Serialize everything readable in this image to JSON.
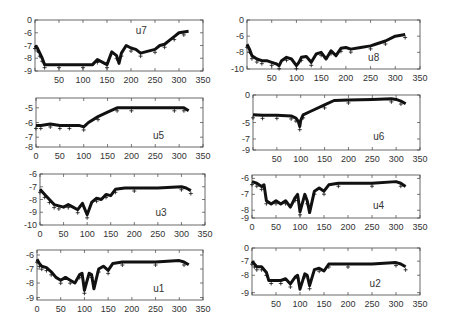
{
  "chart_data": [
    {
      "type": "scatter",
      "title": "u7",
      "label": "u7",
      "xlim": [
        0,
        350
      ],
      "ylim_display": [
        -9,
        0
      ],
      "xticks": [
        50,
        100,
        150,
        200,
        250,
        300,
        350
      ],
      "yticks": [
        "0",
        "-6",
        "-7",
        "-8",
        "-9"
      ],
      "series": [
        {
          "name": "u7",
          "x": [
            0,
            5,
            10,
            15,
            20,
            30,
            50,
            80,
            100,
            120,
            130,
            140,
            150,
            160,
            170,
            175,
            180,
            190,
            200,
            210,
            220,
            240,
            250,
            260,
            270,
            280,
            290,
            300,
            310,
            320
          ],
          "y": [
            -7.0,
            -7.2,
            -7.6,
            -8.0,
            -8.5,
            -8.5,
            -8.5,
            -8.5,
            -8.5,
            -8.5,
            -8.1,
            -8.3,
            -8.5,
            -7.5,
            -7.8,
            -8.4,
            -7.6,
            -7.0,
            -7.2,
            -7.3,
            -7.6,
            -7.4,
            -7.3,
            -7.0,
            -6.9,
            -6.6,
            -6.3,
            -6.0,
            -5.6,
            -5.3
          ]
        }
      ],
      "label_pos": [
        0.6,
        0.2
      ]
    },
    {
      "type": "scatter",
      "title": "u8",
      "label": "u8",
      "xlim": [
        0,
        350
      ],
      "ylim_display": [
        -10,
        0
      ],
      "xticks": [
        50,
        100,
        150,
        200,
        250,
        300,
        350
      ],
      "yticks": [
        "0",
        "-6",
        "-8",
        "-10"
      ],
      "series": [
        {
          "name": "u8",
          "x": [
            0,
            5,
            10,
            20,
            30,
            40,
            50,
            60,
            65,
            70,
            80,
            90,
            100,
            105,
            110,
            120,
            130,
            140,
            150,
            160,
            170,
            180,
            190,
            200,
            210,
            230,
            250,
            260,
            280,
            300,
            320
          ],
          "y": [
            -7.0,
            -7.6,
            -8.4,
            -8.8,
            -9.0,
            -9.0,
            -9.2,
            -9.4,
            -9.6,
            -9.0,
            -8.6,
            -8.8,
            -9.6,
            -9.2,
            -8.6,
            -8.5,
            -9.2,
            -8.2,
            -8.0,
            -8.8,
            -7.8,
            -8.4,
            -7.5,
            -7.4,
            -7.6,
            -7.4,
            -7.2,
            -7.0,
            -6.6,
            -6.0,
            -5.4
          ]
        }
      ],
      "label_pos": [
        0.7,
        0.75
      ]
    },
    {
      "type": "scatter",
      "title": "u5",
      "label": "u5",
      "xlim": [
        0,
        350
      ],
      "ylim_display": [
        -8,
        -4.5
      ],
      "xticks": [
        0,
        50,
        100,
        150,
        200,
        250,
        300,
        350
      ],
      "yticks": [
        "-5",
        "-6",
        "-7",
        "-8"
      ],
      "series": [
        {
          "name": "u5",
          "x": [
            0,
            10,
            30,
            50,
            70,
            90,
            100,
            110,
            130,
            150,
            170,
            180,
            200,
            250,
            290,
            300,
            310,
            320
          ],
          "y": [
            -6.2,
            -6.2,
            -6.1,
            -6.2,
            -6.2,
            -6.2,
            -6.3,
            -6.0,
            -5.6,
            -5.3,
            -5.0,
            -5.0,
            -5.0,
            -5.0,
            -4.9,
            -4.9,
            -5.0,
            -5.2
          ]
        }
      ],
      "label_pos": [
        0.7,
        0.75
      ]
    },
    {
      "type": "scatter",
      "title": "u6",
      "label": "u6",
      "xlim": [
        0,
        350
      ],
      "ylim_display": [
        -9,
        0
      ],
      "xticks": [
        50,
        100,
        150,
        200,
        250,
        300,
        350
      ],
      "yticks": [
        "0",
        "-5",
        "-7",
        "-9"
      ],
      "series": [
        {
          "name": "u6",
          "x": [
            0,
            20,
            50,
            80,
            90,
            95,
            98,
            100,
            105,
            120,
            150,
            170,
            200,
            250,
            290,
            300,
            310,
            320
          ],
          "y": [
            -3.6,
            -3.7,
            -3.7,
            -3.8,
            -4.2,
            -4.8,
            -5.5,
            -4.6,
            -3.6,
            -3.0,
            -1.8,
            -1.0,
            -0.9,
            -0.8,
            -0.7,
            -0.8,
            -1.1,
            -1.6
          ]
        }
      ],
      "label_pos": [
        0.72,
        0.75
      ]
    },
    {
      "type": "scatter",
      "title": "u3",
      "label": "u3",
      "xlim": [
        0,
        350
      ],
      "ylim_display": [
        -10,
        -6
      ],
      "xticks": [
        0,
        50,
        100,
        150,
        200,
        250,
        300,
        350
      ],
      "yticks": [
        "-6",
        "-7",
        "-8",
        "-9",
        "-10"
      ],
      "series": [
        {
          "name": "u3",
          "x": [
            0,
            10,
            20,
            30,
            40,
            50,
            60,
            70,
            80,
            90,
            100,
            110,
            120,
            130,
            140,
            150,
            160,
            180,
            200,
            250,
            300,
            310,
            320
          ],
          "y": [
            -7.2,
            -7.6,
            -8.0,
            -8.4,
            -8.5,
            -8.6,
            -8.4,
            -8.6,
            -8.8,
            -8.3,
            -9.2,
            -8.2,
            -7.9,
            -8.0,
            -7.6,
            -7.7,
            -7.2,
            -7.1,
            -7.1,
            -7.1,
            -7.0,
            -7.1,
            -7.3
          ]
        }
      ],
      "label_pos": [
        0.7,
        0.75
      ]
    },
    {
      "type": "scatter",
      "title": "u4",
      "label": "u4",
      "xlim": [
        0,
        350
      ],
      "ylim_display": [
        -9,
        -5.5
      ],
      "xticks": [
        0,
        50,
        100,
        150,
        200,
        250,
        300,
        350
      ],
      "yticks": [
        "-6",
        "-7",
        "-8",
        "-9"
      ],
      "series": [
        {
          "name": "u4",
          "x": [
            0,
            10,
            20,
            25,
            30,
            40,
            50,
            60,
            70,
            80,
            90,
            95,
            100,
            110,
            115,
            120,
            130,
            140,
            150,
            160,
            180,
            200,
            250,
            300,
            310,
            320
          ],
          "y": [
            -6.2,
            -6.3,
            -6.5,
            -6.4,
            -7.4,
            -7.6,
            -7.4,
            -7.6,
            -7.4,
            -7.8,
            -7.2,
            -7.0,
            -8.2,
            -7.0,
            -7.4,
            -8.3,
            -6.8,
            -6.6,
            -6.8,
            -6.4,
            -6.3,
            -6.3,
            -6.3,
            -6.2,
            -6.3,
            -6.5
          ]
        }
      ],
      "label_pos": [
        0.72,
        0.7
      ]
    },
    {
      "type": "scatter",
      "title": "u1",
      "label": "u1",
      "xlim": [
        0,
        350
      ],
      "ylim_display": [
        -9,
        -5.7
      ],
      "xticks": [
        0,
        50,
        100,
        150,
        200,
        250,
        300,
        350
      ],
      "yticks": [
        "-6",
        "-7",
        "-8",
        "-9"
      ],
      "series": [
        {
          "name": "u1",
          "x": [
            0,
            5,
            10,
            20,
            30,
            40,
            50,
            60,
            70,
            80,
            90,
            95,
            100,
            110,
            115,
            120,
            130,
            140,
            150,
            160,
            180,
            200,
            250,
            300,
            310,
            320
          ],
          "y": [
            -6.3,
            -6.6,
            -6.8,
            -6.9,
            -7.2,
            -7.6,
            -7.8,
            -7.6,
            -7.8,
            -8.0,
            -7.4,
            -7.3,
            -8.5,
            -7.3,
            -7.4,
            -8.4,
            -7.0,
            -6.8,
            -7.1,
            -6.6,
            -6.5,
            -6.5,
            -6.5,
            -6.4,
            -6.5,
            -6.7
          ]
        }
      ],
      "label_pos": [
        0.7,
        0.75
      ]
    },
    {
      "type": "scatter",
      "title": "u2",
      "label": "u2",
      "xlim": [
        0,
        350
      ],
      "ylim_display": [
        -9,
        0
      ],
      "xticks": [
        50,
        100,
        150,
        200,
        250,
        300,
        350
      ],
      "yticks": [
        "0",
        "-7",
        "-8",
        "-9"
      ],
      "series": [
        {
          "name": "u2",
          "x": [
            0,
            5,
            10,
            20,
            30,
            35,
            40,
            50,
            60,
            70,
            80,
            90,
            95,
            100,
            110,
            115,
            120,
            130,
            140,
            150,
            160,
            180,
            200,
            250,
            300,
            310,
            320
          ],
          "y": [
            -7.0,
            -7.2,
            -7.4,
            -7.4,
            -7.8,
            -8.3,
            -8.3,
            -8.3,
            -8.3,
            -8.2,
            -8.5,
            -8.1,
            -8.0,
            -8.8,
            -7.9,
            -8.0,
            -8.6,
            -7.6,
            -7.5,
            -7.7,
            -7.2,
            -7.2,
            -7.2,
            -7.2,
            -7.1,
            -7.2,
            -7.4
          ]
        }
      ],
      "label_pos": [
        0.7,
        0.75
      ]
    }
  ],
  "panels": [
    {
      "label": "u7",
      "box": [
        35,
        20,
        203,
        71
      ],
      "ymap": {
        "0": 0.0,
        "-6": 0.25,
        "-7": 0.5,
        "-8": 0.75,
        "-9": 1.0
      },
      "xtick_labels_start": 50
    },
    {
      "label": "u8",
      "box": [
        247,
        20,
        420,
        69
      ],
      "ymap": {
        "0": 0.0,
        "-6": 0.33,
        "-8": 0.66,
        "-10": 1.0
      },
      "xtick_labels_start": 50
    },
    {
      "label": "u5",
      "box": [
        36,
        98,
        203,
        147
      ],
      "ymap": {
        "-5": 0.2,
        "-6": 0.5,
        "-7": 0.8,
        "-8": 1.0
      },
      "xtick_labels_start": 0
    },
    {
      "label": "u6",
      "box": [
        253,
        95,
        420,
        150
      ],
      "ymap": {
        "0": 0.0,
        "-5": 0.5,
        "-7": 0.8,
        "-9": 1.0
      },
      "xtick_labels_start": 50
    },
    {
      "label": "u3",
      "box": [
        40,
        174,
        205,
        225
      ],
      "ymap": {
        "-6": 0.0,
        "-7": 0.25,
        "-8": 0.5,
        "-9": 0.75,
        "-10": 1.0
      },
      "xtick_labels_start": 0
    },
    {
      "label": "u4",
      "box": [
        252,
        175,
        420,
        218
      ],
      "ymap": {
        "-6": 0.08,
        "-7": 0.45,
        "-8": 0.82,
        "-9": 1.0
      },
      "xtick_labels_start": 0
    },
    {
      "label": "u1",
      "box": [
        37,
        250,
        203,
        300
      ],
      "ymap": {
        "-6": 0.1,
        "-7": 0.38,
        "-8": 0.66,
        "-9": 0.95
      },
      "xtick_labels_start": 0
    },
    {
      "label": "u2",
      "box": [
        252,
        248,
        420,
        295
      ],
      "ymap": {
        "0": 0.0,
        "-7": 0.28,
        "-8": 0.58,
        "-9": 0.95
      },
      "xtick_labels_start": 50
    }
  ],
  "colors": {
    "marker": "#111111",
    "axis": "#444444",
    "text": "#333333",
    "background": "#ffffff"
  }
}
